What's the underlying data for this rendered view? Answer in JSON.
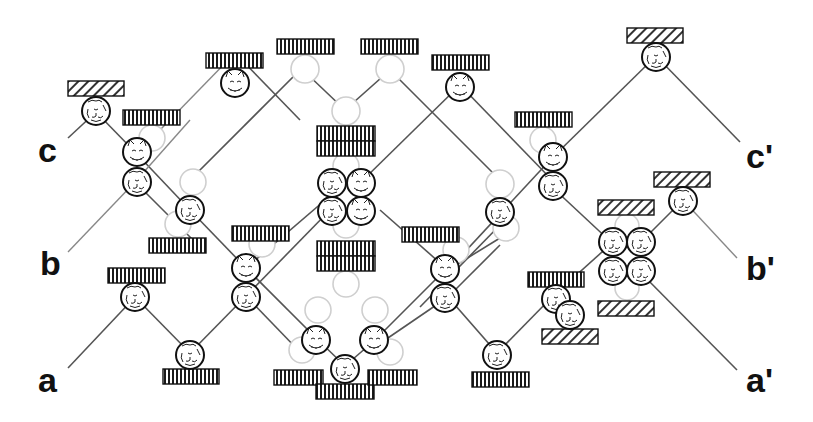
{
  "diagram": {
    "type": "qubit/cat-state braiding diagram",
    "labels": {
      "c": "c",
      "b": "b",
      "a": "a",
      "c_prime": "c'",
      "b_prime": "b'",
      "a_prime": "a'"
    },
    "colors": {
      "wire": "#555555",
      "wire_light": "#888888",
      "ghost_circle": "#cfcfcf",
      "cat_outline": "#111111",
      "bar_fill": "#111111",
      "background": "#ffffff"
    },
    "legend_items": {
      "vertical_bar_box": "vertical-striped box",
      "hatched_box": "diagonal-hatched box",
      "cat_circle": "cat-face circle",
      "ghost_circle": "light empty circle"
    }
  }
}
